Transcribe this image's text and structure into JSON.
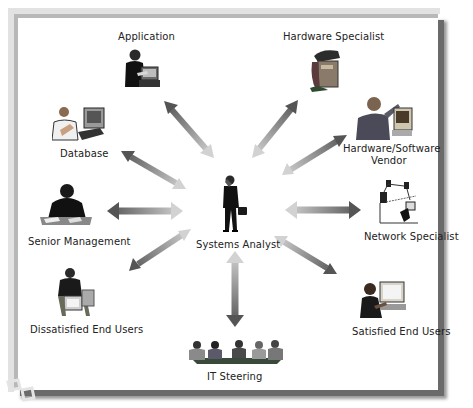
{
  "diagram": {
    "center": {
      "label": "Systems Analyst",
      "icon": "businessman-phone-briefcase-icon"
    },
    "nodes": [
      {
        "id": "application",
        "label": "Application",
        "icon": "person-at-computer-icon"
      },
      {
        "id": "hardware-specialist",
        "label": "Hardware Specialist",
        "icon": "hardware-repair-icon"
      },
      {
        "id": "hardware-software-vendor",
        "label_line1": "Hardware/Software",
        "label_line2": "Vendor",
        "icon": "vendor-with-computer-icon"
      },
      {
        "id": "network-specialist",
        "label": "Network Specialist",
        "icon": "network-diagram-icon"
      },
      {
        "id": "satisfied-end-users",
        "label": "Satisfied End Users",
        "icon": "happy-user-computer-icon"
      },
      {
        "id": "it-steering",
        "label": "IT Steering",
        "icon": "meeting-table-icon"
      },
      {
        "id": "dissatisfied-end-users",
        "label": "Dissatisfied End Users",
        "icon": "frustrated-user-icon"
      },
      {
        "id": "senior-management",
        "label": "Senior Management",
        "icon": "executive-at-desk-icon"
      },
      {
        "id": "database",
        "label": "Database",
        "icon": "person-with-computer-icon"
      }
    ],
    "connector": "double-headed-gradient-arrow",
    "colors": {
      "arrow_dark": "#555555",
      "arrow_light": "#cfcfcf",
      "frame_shadow": "#6a6a6a",
      "text": "#222222"
    }
  }
}
